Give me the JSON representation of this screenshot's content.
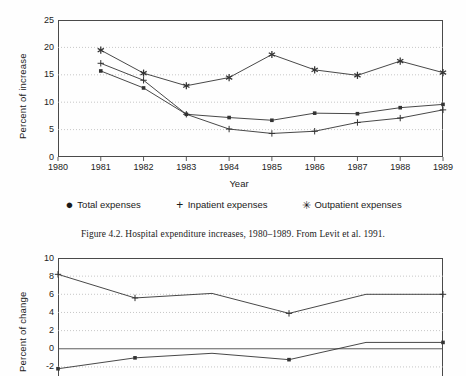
{
  "figure_top": {
    "ylabel": "Percent of increase",
    "xlabel": "Year",
    "yticks": [
      "25",
      "20",
      "15",
      "10",
      "5",
      "0"
    ],
    "xticks": [
      "1980",
      "1981",
      "1982",
      "1983",
      "1984",
      "1985",
      "1986",
      "1987",
      "1988",
      "1989"
    ],
    "legend": [
      {
        "marker": "dot",
        "glyph": "●",
        "label": "Total expenses"
      },
      {
        "marker": "plus",
        "glyph": "+",
        "label": "Inpatient expenses"
      },
      {
        "marker": "star",
        "glyph": "✳",
        "label": "Outpatient expenses"
      }
    ],
    "caption": "Figure 4.2. Hospital expenditure increases, 1980–1989. From Levit et al. 1991."
  },
  "figure_bottom": {
    "ylabel": "Percent of change",
    "yticks": [
      "10",
      "8",
      "6",
      "4",
      "2",
      "0",
      "-2"
    ]
  },
  "colors": {
    "line": "#333333",
    "frame": "#4a4a4a",
    "grid": "#b9b9b9",
    "text": "#1a1a1a",
    "background": "#ffffff"
  },
  "chart_data": [
    {
      "id": "hospital-expenditure-increases",
      "type": "line",
      "title": "Hospital expenditure increases, 1980-1989",
      "xlabel": "Year",
      "ylabel": "Percent of increase",
      "xlim": [
        1980,
        1989
      ],
      "ylim": [
        0,
        25
      ],
      "ytick_values": [
        0,
        5,
        10,
        15,
        20,
        25
      ],
      "xtick_values": [
        1980,
        1981,
        1982,
        1983,
        1984,
        1985,
        1986,
        1987,
        1988,
        1989
      ],
      "grid": "horizontal-dotted",
      "legend_position": "below-plot",
      "x": [
        1981,
        1982,
        1983,
        1984,
        1985,
        1986,
        1987,
        1988,
        1989
      ],
      "series": [
        {
          "name": "Total expenses",
          "marker": "dot",
          "values": [
            15.7,
            12.6,
            7.8,
            7.2,
            6.7,
            8.0,
            7.9,
            9.0,
            9.6
          ]
        },
        {
          "name": "Inpatient expenses",
          "marker": "plus",
          "values": [
            17.1,
            14.0,
            7.8,
            5.1,
            4.3,
            4.7,
            6.3,
            7.1,
            8.6
          ]
        },
        {
          "name": "Outpatient expenses",
          "marker": "star",
          "values": [
            19.5,
            15.3,
            13.0,
            14.5,
            18.7,
            15.9,
            14.9,
            17.5,
            15.4
          ]
        }
      ]
    },
    {
      "id": "percent-of-change-partial",
      "type": "line",
      "title": "",
      "xlabel": "",
      "ylabel": "Percent of change",
      "ylim": [
        -3,
        10
      ],
      "ytick_values": [
        -2,
        0,
        2,
        4,
        6,
        8,
        10
      ],
      "grid": "horizontal-dotted",
      "note": "Chart is cropped at the bottom edge of the page image",
      "x": [
        0,
        1,
        2,
        3,
        4,
        5
      ],
      "series": [
        {
          "name": "upper-series",
          "marker": "plus",
          "values": [
            8.2,
            5.6,
            6.1,
            3.9,
            6.0,
            6.0
          ]
        },
        {
          "name": "lower-series",
          "marker": "dot",
          "values": [
            -2.2,
            -1.0,
            -0.5,
            -1.2,
            0.7,
            0.7
          ]
        }
      ]
    }
  ]
}
